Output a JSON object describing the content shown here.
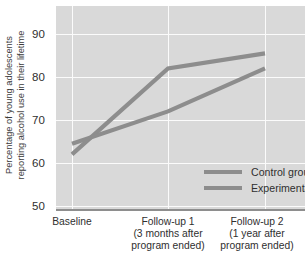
{
  "chart_data": {
    "type": "line",
    "title": "",
    "xlabel": "",
    "ylabel": "Percentage of young adolescents reporting alcohol use in their lifetime",
    "ylabel_line1": "Percentage of young adolescents",
    "ylabel_line2": "reporting alcohol use in their lifetime",
    "categories": [
      "Baseline",
      "Follow-up 1",
      "Follow-up 2"
    ],
    "category_sublabels": [
      [
        "Baseline"
      ],
      [
        "Follow-up 1",
        "(3 months after",
        "program ended)"
      ],
      [
        "Follow-up 2",
        "(1 year after",
        "program ended)"
      ]
    ],
    "series": [
      {
        "name": "Control group",
        "values": [
          62,
          82,
          85.5
        ],
        "color": "#8d8d8d"
      },
      {
        "name": "Experimental group",
        "values": [
          64.5,
          72,
          82
        ],
        "color": "#8d8d8d"
      }
    ],
    "ylim": [
      50,
      90
    ],
    "yticks": [
      90,
      80,
      70,
      60,
      50
    ],
    "ytick_labels": [
      "90",
      "80",
      "70",
      "60",
      "50"
    ],
    "grid": true,
    "legend_position": "inside-lower-right",
    "legend_entries": [
      "Control group",
      "Experimental group"
    ],
    "plot_background": "#d9d9d9",
    "gridline_color": "#fbfbfb",
    "axis_color": "#8e8e8e"
  }
}
